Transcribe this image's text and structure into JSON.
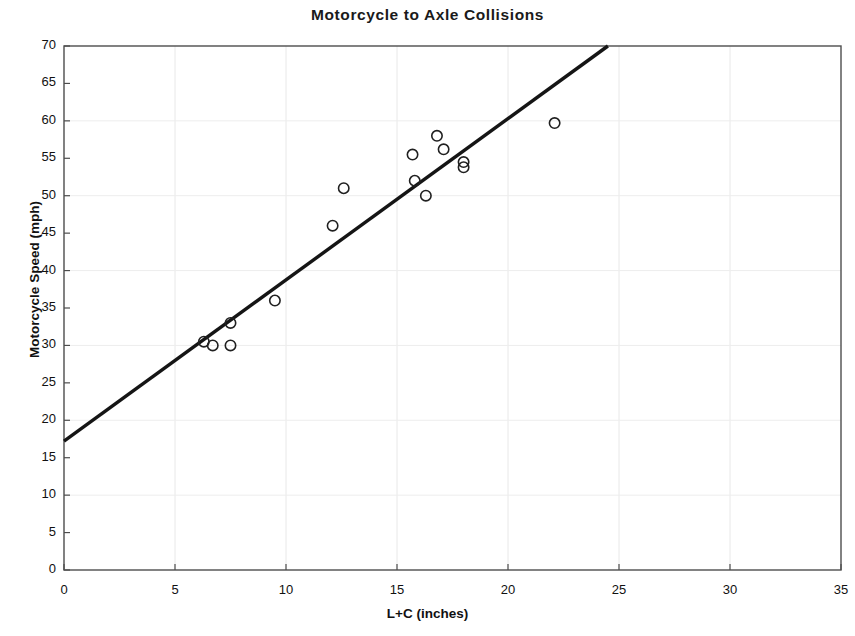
{
  "chart_data": {
    "type": "scatter",
    "title": "Motorcycle to Axle Collisions",
    "xlabel": "L+C (inches)",
    "ylabel": "Motorcycle Speed (mph)",
    "xlim": [
      0,
      35
    ],
    "ylim": [
      0,
      70
    ],
    "xticks": [
      0,
      5,
      10,
      15,
      20,
      25,
      30,
      35
    ],
    "yticks": [
      0,
      5,
      10,
      15,
      20,
      25,
      30,
      35,
      40,
      45,
      50,
      55,
      60,
      65,
      70
    ],
    "grid": true,
    "legend": "none",
    "marker": "open-circle",
    "points": [
      {
        "x": 6.3,
        "y": 30.5
      },
      {
        "x": 6.7,
        "y": 30.0
      },
      {
        "x": 7.5,
        "y": 30.0
      },
      {
        "x": 7.5,
        "y": 33.0
      },
      {
        "x": 9.5,
        "y": 36.0
      },
      {
        "x": 12.1,
        "y": 46.0
      },
      {
        "x": 12.6,
        "y": 51.0
      },
      {
        "x": 15.7,
        "y": 55.5
      },
      {
        "x": 15.8,
        "y": 52.0
      },
      {
        "x": 16.3,
        "y": 50.0
      },
      {
        "x": 16.8,
        "y": 58.0
      },
      {
        "x": 17.1,
        "y": 56.2
      },
      {
        "x": 18.0,
        "y": 54.5
      },
      {
        "x": 18.0,
        "y": 53.8
      },
      {
        "x": 22.1,
        "y": 59.7
      }
    ],
    "trendline": {
      "label": "linear fit",
      "x_start": 0.0,
      "y_start": 17.2,
      "x_end": 24.5,
      "y_end": 70.0
    }
  }
}
